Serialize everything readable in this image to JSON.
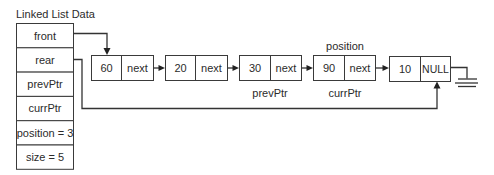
{
  "title": "Linked List Data",
  "list_data_fields": [
    {
      "label": "front"
    },
    {
      "label": "rear"
    },
    {
      "label": "prevPtr"
    },
    {
      "label": "currPtr"
    },
    {
      "label": "position = 3"
    },
    {
      "label": "size = 5"
    }
  ],
  "nodes": [
    {
      "value": "60",
      "link": "next"
    },
    {
      "value": "20",
      "link": "next"
    },
    {
      "value": "30",
      "link": "next"
    },
    {
      "value": "90",
      "link": "next"
    },
    {
      "value": "10",
      "link": "NULL"
    }
  ],
  "annotations": {
    "position_label": "position",
    "prev_ptr_label": "prevPtr",
    "curr_ptr_label": "currPtr"
  },
  "connections": [
    {
      "from": "front",
      "to": "node-60"
    },
    {
      "from": "rear",
      "to": "node-10"
    },
    {
      "from": "node-60",
      "to": "node-20"
    },
    {
      "from": "node-20",
      "to": "node-30"
    },
    {
      "from": "node-30",
      "to": "node-90"
    },
    {
      "from": "node-90",
      "to": "node-10"
    },
    {
      "from": "node-10",
      "to": "ground-null"
    }
  ]
}
